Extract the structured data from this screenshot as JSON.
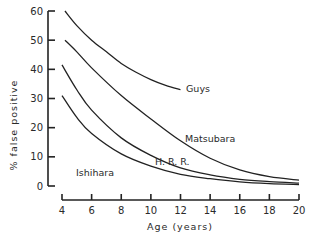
{
  "chart_data": {
    "type": "line",
    "title": "",
    "xlabel": "Age (years)",
    "ylabel": "% false positive",
    "xlim": [
      4,
      20
    ],
    "ylim": [
      0,
      60
    ],
    "x_ticks": [
      4,
      6,
      8,
      10,
      12,
      14,
      16,
      18,
      20
    ],
    "y_ticks": [
      0,
      10,
      20,
      30,
      40,
      50,
      60
    ],
    "grid": false,
    "legend": "inline labels next to curves",
    "series": [
      {
        "name": "Guys",
        "x": [
          4.2,
          5,
          6,
          7,
          8,
          9,
          10,
          11,
          12
        ],
        "values": [
          60,
          55,
          50,
          46,
          42,
          39,
          36.5,
          34.5,
          33
        ]
      },
      {
        "name": "Matsubara",
        "x": [
          4.2,
          5,
          6,
          8,
          10,
          12,
          14,
          16,
          18,
          20
        ],
        "values": [
          50,
          46,
          40.5,
          31,
          23,
          15.5,
          9.5,
          5.5,
          3.2,
          2
        ]
      },
      {
        "name": "H. R. R.",
        "x": [
          4,
          5,
          6,
          8,
          10,
          12,
          14,
          16,
          18,
          20
        ],
        "values": [
          41.5,
          33,
          26,
          16.5,
          10.5,
          6.2,
          3.8,
          2.3,
          1.5,
          1
        ]
      },
      {
        "name": "Ishihara",
        "x": [
          4,
          5,
          6,
          8,
          10,
          12,
          14,
          16,
          18,
          20
        ],
        "values": [
          31,
          23.5,
          18,
          11,
          6.8,
          4,
          2.5,
          1.4,
          0.8,
          0.5
        ]
      }
    ]
  },
  "labels": {
    "xlabel": "Age (years)",
    "ylabel": "% false positive",
    "guys": "Guys",
    "matsubara": "Matsubara",
    "hrr": "H. R. R.",
    "ishihara": "Ishihara"
  }
}
